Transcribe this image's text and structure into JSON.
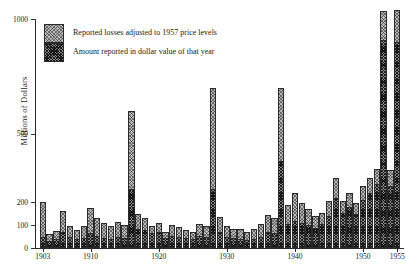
{
  "chart_data": {
    "type": "bar",
    "title": "",
    "xlabel": "",
    "ylabel": "Millions of Dollars",
    "ylim": [
      0,
      1000
    ],
    "xlim": [
      1902,
      1956
    ],
    "grid": false,
    "legend_position": "top-left",
    "yticks": [
      0,
      100,
      200,
      500,
      1000
    ],
    "ytick_labels": [
      "0",
      "100",
      "200",
      "500",
      "1000"
    ],
    "xticks": [
      1903,
      1910,
      1920,
      1930,
      1940,
      1950,
      1955
    ],
    "xtick_labels": [
      "1903",
      "1910",
      "1920",
      "1930",
      "1940",
      "1950",
      "1955"
    ],
    "stacked": true,
    "categories": [
      1903,
      1904,
      1905,
      1906,
      1907,
      1908,
      1909,
      1910,
      1911,
      1912,
      1913,
      1914,
      1915,
      1916,
      1917,
      1918,
      1919,
      1920,
      1921,
      1922,
      1923,
      1924,
      1925,
      1926,
      1927,
      1928,
      1929,
      1930,
      1931,
      1932,
      1933,
      1934,
      1935,
      1936,
      1937,
      1938,
      1939,
      1940,
      1941,
      1942,
      1943,
      1944,
      1945,
      1946,
      1947,
      1948,
      1949,
      1950,
      1951,
      1952,
      1953,
      1954,
      1955
    ],
    "series": [
      {
        "name": "Amount reported in dollar value of that year",
        "values": [
          40,
          22,
          30,
          60,
          40,
          30,
          35,
          55,
          45,
          35,
          30,
          40,
          35,
          250,
          75,
          70,
          55,
          60,
          35,
          45,
          40,
          35,
          30,
          45,
          40,
          250,
          60,
          40,
          35,
          30,
          25,
          30,
          40,
          60,
          55,
          370,
          95,
          110,
          100,
          90,
          80,
          95,
          130,
          210,
          145,
          170,
          140,
          200,
          230,
          270,
          900,
          260,
          890
        ]
      },
      {
        "name": "Reported losses adjusted to 1957 price levels",
        "values": [
          160,
          38,
          45,
          100,
          55,
          50,
          60,
          120,
          85,
          75,
          65,
          75,
          65,
          350,
          75,
          60,
          40,
          50,
          35,
          55,
          50,
          45,
          40,
          60,
          55,
          450,
          75,
          55,
          50,
          55,
          45,
          55,
          65,
          85,
          75,
          330,
          95,
          130,
          95,
          80,
          60,
          60,
          75,
          95,
          60,
          70,
          55,
          70,
          75,
          75,
          135,
          80,
          150
        ]
      }
    ],
    "series_totals": [
      200,
      60,
      75,
      160,
      95,
      80,
      95,
      175,
      130,
      110,
      95,
      115,
      100,
      600,
      150,
      130,
      95,
      110,
      70,
      100,
      90,
      80,
      70,
      105,
      95,
      700,
      135,
      95,
      85,
      85,
      70,
      85,
      105,
      145,
      130,
      700,
      190,
      240,
      195,
      170,
      140,
      155,
      205,
      305,
      205,
      240,
      195,
      270,
      305,
      345,
      1035,
      340,
      1040
    ]
  },
  "legend": {
    "items": [
      {
        "label": "Reported losses adjusted to 1957 price levels",
        "swatch": "light-hatch"
      },
      {
        "label": "Amount reported in dollar value of that year",
        "swatch": "dark-hatch"
      }
    ]
  }
}
